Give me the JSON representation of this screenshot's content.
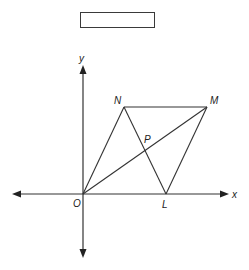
{
  "answer_box": {
    "content": ""
  },
  "axes": {
    "x_label": "x",
    "y_label": "y",
    "origin_label": "O"
  },
  "points": {
    "O": {
      "label": "O",
      "x": 83,
      "y": 194
    },
    "N": {
      "label": "N",
      "x": 124,
      "y": 107
    },
    "M": {
      "label": "M",
      "x": 207,
      "y": 107
    },
    "L": {
      "label": "L",
      "x": 166,
      "y": 194
    },
    "P": {
      "label": "P",
      "x": 145,
      "y": 150
    }
  },
  "segments": [
    [
      "O",
      "N"
    ],
    [
      "N",
      "M"
    ],
    [
      "M",
      "L"
    ],
    [
      "O",
      "L"
    ],
    [
      "O",
      "M"
    ],
    [
      "N",
      "L"
    ]
  ],
  "colors": {
    "stroke": "#333333",
    "background": "#ffffff"
  }
}
